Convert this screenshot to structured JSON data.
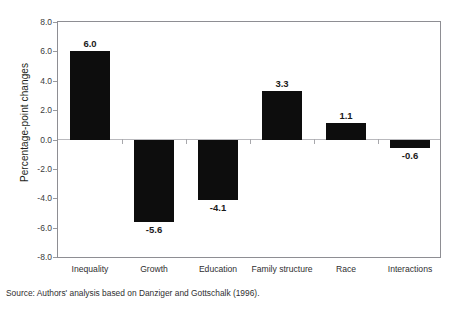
{
  "chart_data": {
    "type": "bar",
    "title": "",
    "xlabel": "",
    "ylabel": "Percentage-point changes",
    "categories": [
      "Inequality",
      "Growth",
      "Education",
      "Family structure",
      "Race",
      "Interactions"
    ],
    "values": [
      6.0,
      -5.6,
      -4.1,
      3.3,
      1.1,
      -0.6
    ],
    "value_labels": [
      "6.0",
      "-5.6",
      "-4.1",
      "3.3",
      "1.1",
      "-0.6"
    ],
    "ylim": [
      -8.0,
      8.0
    ],
    "ytick_labels": [
      "8.0",
      "6.0",
      "4.0",
      "2.0",
      "0.0",
      "-2.0",
      "-4.0",
      "-6.0",
      "-8.0"
    ],
    "ytick_values": [
      8.0,
      6.0,
      4.0,
      2.0,
      0.0,
      -2.0,
      -4.0,
      -6.0,
      -8.0
    ],
    "grid": false,
    "legend": false,
    "bar_color": "#0d0d0d",
    "frame_color": "#8e8e93",
    "baseline_color": "#b9b9bd"
  },
  "footer": {
    "source": "Source: Authors' analysis based on Danziger and Gottschalk (1996)."
  },
  "title_sliver": {
    "text": ""
  }
}
